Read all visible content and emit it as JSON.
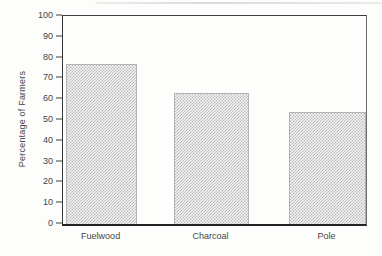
{
  "chart_data": {
    "type": "bar",
    "categories": [
      "Fuelwood",
      "Charcoal",
      "Pole"
    ],
    "values": [
      77,
      63,
      54
    ],
    "title": "",
    "xlabel": "",
    "ylabel": "Percentage of Farmers",
    "ylim": [
      0,
      100
    ],
    "ytick_step": 10,
    "ytick_labels": [
      "0",
      "10",
      "20",
      "30",
      "40",
      "50",
      "60",
      "70",
      "80",
      "90",
      "100"
    ],
    "grid": false,
    "legend": false,
    "bar_fill_style": "halftone-dot-pattern",
    "bar_dot_color": "#b9b9b9",
    "bar_base_color": "#f3f3f2",
    "axis_color": "#3a3a3a",
    "text_color": "#474747",
    "bar_positions_pct": [
      {
        "left": 1.0,
        "width": 23.5
      },
      {
        "left": 36.6,
        "width": 24.8
      },
      {
        "left": 74.6,
        "width": 25.4
      }
    ]
  }
}
